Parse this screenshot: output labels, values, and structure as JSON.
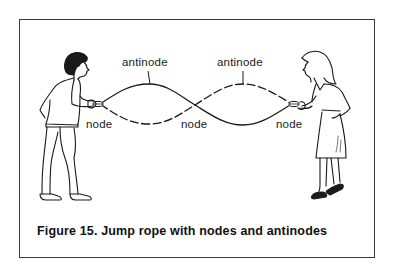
{
  "figure": {
    "caption": "Figure 15.  Jump rope with nodes and antinodes",
    "labels": {
      "antinode_left": "antinode",
      "antinode_right": "antinode",
      "node_left": "node",
      "node_middle": "node",
      "node_right": "node"
    },
    "colors": {
      "ink": "#1a1a1a",
      "border": "#3a3a3a",
      "background": "#ffffff"
    },
    "rope": {
      "left_end": [
        100,
        104
      ],
      "middle_node": [
        195,
        105
      ],
      "right_end": [
        292,
        104
      ],
      "solid_wave": "solid rope: crest at left antinode, trough at right antinode",
      "dashed_wave": "dashed rope: trough at left antinode, crest at right antinode"
    },
    "people": [
      {
        "name": "boy",
        "position": "left",
        "holding": "left end of rope"
      },
      {
        "name": "woman",
        "position": "right",
        "holding": "right end of rope"
      }
    ]
  }
}
